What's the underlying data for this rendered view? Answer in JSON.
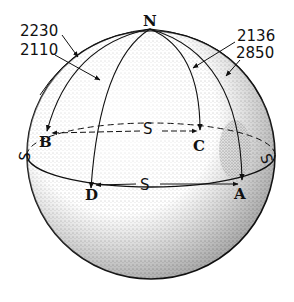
{
  "diagram": {
    "pole_label": "N",
    "points": [
      {
        "id": "B",
        "label": "B"
      },
      {
        "id": "C",
        "label": "C"
      },
      {
        "id": "D",
        "label": "D"
      },
      {
        "id": "A",
        "label": "A"
      }
    ],
    "equator_labels": {
      "back_center": "S",
      "front_center": "S",
      "left_edge": "S",
      "right_edge": "S"
    },
    "distance_labels": {
      "left_top": "2230",
      "left_bottom": "2110",
      "right_top": "2136",
      "right_bottom": "2850"
    },
    "colors": {
      "ink": "#111111",
      "background": "#ffffff",
      "stipple": "#555555"
    }
  }
}
